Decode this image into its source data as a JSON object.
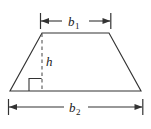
{
  "figure": {
    "kind": "geometry-diagram",
    "shape_name": "trapezoid",
    "stroke_color": "#333333",
    "dash_color": "#555555",
    "background_color": "#ffffff",
    "labels": {
      "top_base": {
        "symbol": "b",
        "subscript": "1"
      },
      "bottom_base": {
        "symbol": "b",
        "subscript": "2"
      },
      "height": {
        "symbol": "h",
        "subscript": ""
      }
    },
    "annotations": {
      "right_angle_marker": "right-angle",
      "altitude_style": "dashed"
    },
    "dimension_lines": [
      {
        "name": "b1-dimension",
        "position": "above-top-base",
        "arrows": "both"
      },
      {
        "name": "b2-dimension",
        "position": "below-bottom-base",
        "arrows": "both"
      }
    ]
  },
  "geometry": {
    "trapezoid_points": "42,33 109,33 141,91 10,91",
    "altitude": {
      "x": 42,
      "y_top": 33,
      "y_bottom": 91
    },
    "b1_line": {
      "y": 21,
      "x_start": 40,
      "x_end": 111
    },
    "b2_line": {
      "y": 107,
      "x_start": 8,
      "x_end": 143
    }
  }
}
